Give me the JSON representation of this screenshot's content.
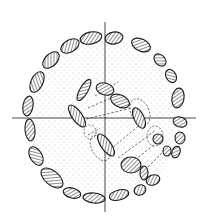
{
  "diagram": {
    "type": "archaeological-plan",
    "colors": {
      "ink": "#1a1a1a",
      "background": "#ffffff",
      "stipple": "#8a8a8a"
    },
    "axes": {
      "horizontal": {
        "x1": 12,
        "y1": 118,
        "x2": 196,
        "y2": 118
      },
      "vertical": {
        "x1": 105,
        "y1": 22,
        "x2": 105,
        "y2": 212
      }
    },
    "outer_ring": {
      "center": [
        105,
        118
      ],
      "radius": 82,
      "gap": "east-southeast opening between approx 10 and 60 degrees below east"
    },
    "outer_stones": [
      {
        "cx": 114,
        "cy": 38,
        "rx": 9,
        "ry": 6,
        "rot": -10
      },
      {
        "cx": 141,
        "cy": 45,
        "rx": 10,
        "ry": 6,
        "rot": 25
      },
      {
        "cx": 160,
        "cy": 60,
        "rx": 7,
        "ry": 5,
        "rot": 45
      },
      {
        "cx": 171,
        "cy": 76,
        "rx": 7,
        "ry": 5,
        "rot": 60
      },
      {
        "cx": 178,
        "cy": 98,
        "rx": 6,
        "ry": 10,
        "rot": 10
      },
      {
        "cx": 180,
        "cy": 122,
        "rx": 7,
        "ry": 5,
        "rot": 15
      },
      {
        "cx": 180,
        "cy": 138,
        "rx": 5,
        "ry": 6,
        "rot": 0
      },
      {
        "cx": 176,
        "cy": 152,
        "rx": 4,
        "ry": 6,
        "rot": 20
      },
      {
        "cx": 91,
        "cy": 38,
        "rx": 11,
        "ry": 6,
        "rot": -12
      },
      {
        "cx": 70,
        "cy": 46,
        "rx": 10,
        "ry": 6,
        "rot": -30
      },
      {
        "cx": 51,
        "cy": 60,
        "rx": 10,
        "ry": 6,
        "rot": -45
      },
      {
        "cx": 37,
        "cy": 82,
        "rx": 11,
        "ry": 6,
        "rot": -65
      },
      {
        "cx": 28,
        "cy": 106,
        "rx": 5,
        "ry": 10,
        "rot": 10
      },
      {
        "cx": 30,
        "cy": 130,
        "rx": 5,
        "ry": 11,
        "rot": -5
      },
      {
        "cx": 36,
        "cy": 156,
        "rx": 10,
        "ry": 6,
        "rot": 60
      },
      {
        "cx": 52,
        "cy": 178,
        "rx": 13,
        "ry": 7,
        "rot": 40
      },
      {
        "cx": 72,
        "cy": 193,
        "rx": 9,
        "ry": 5,
        "rot": 15
      },
      {
        "cx": 94,
        "cy": 198,
        "rx": 11,
        "ry": 5,
        "rot": 5
      },
      {
        "cx": 119,
        "cy": 195,
        "rx": 10,
        "ry": 5,
        "rot": -15
      },
      {
        "cx": 140,
        "cy": 190,
        "rx": 6,
        "ry": 5,
        "rot": -25
      }
    ],
    "inner_stones": [
      {
        "cx": 84,
        "cy": 90,
        "rx": 4,
        "ry": 12,
        "rot": 30
      },
      {
        "cx": 105,
        "cy": 89,
        "rx": 9,
        "ry": 6,
        "rot": 15
      },
      {
        "cx": 120,
        "cy": 101,
        "rx": 10,
        "ry": 6,
        "rot": 25
      },
      {
        "cx": 139,
        "cy": 118,
        "rx": 5,
        "ry": 11,
        "rot": -25
      },
      {
        "cx": 77,
        "cy": 116,
        "rx": 5,
        "ry": 13,
        "rot": -35
      },
      {
        "cx": 106,
        "cy": 145,
        "rx": 5,
        "ry": 13,
        "rot": -35
      },
      {
        "cx": 131,
        "cy": 165,
        "rx": 10,
        "ry": 8,
        "rot": 0
      },
      {
        "cx": 144,
        "cy": 173,
        "rx": 4,
        "ry": 7,
        "rot": 0
      },
      {
        "cx": 153,
        "cy": 180,
        "rx": 7,
        "ry": 5,
        "rot": -20
      },
      {
        "cx": 158,
        "cy": 139,
        "rx": 5,
        "ry": 5,
        "rot": 0
      },
      {
        "cx": 167,
        "cy": 151,
        "rx": 4,
        "ry": 5,
        "rot": 0
      }
    ],
    "dashed_lines": [
      {
        "x1": 88,
        "y1": 108,
        "x2": 118,
        "y2": 95
      },
      {
        "x1": 82,
        "y1": 120,
        "x2": 132,
        "y2": 108
      },
      {
        "x1": 95,
        "y1": 96,
        "x2": 118,
        "y2": 82
      },
      {
        "x1": 110,
        "y1": 150,
        "x2": 142,
        "y2": 123
      },
      {
        "x1": 118,
        "y1": 158,
        "x2": 156,
        "y2": 130
      },
      {
        "x1": 135,
        "y1": 160,
        "x2": 160,
        "y2": 140
      },
      {
        "x1": 145,
        "y1": 170,
        "x2": 165,
        "y2": 150
      },
      {
        "x1": 88,
        "y1": 135,
        "x2": 100,
        "y2": 128
      }
    ],
    "dashed_outlines": [
      {
        "cx": 140,
        "cy": 112,
        "rx": 9,
        "ry": 14,
        "rot": -25
      },
      {
        "cx": 100,
        "cy": 148,
        "rx": 8,
        "ry": 14,
        "rot": -30
      },
      {
        "cx": 155,
        "cy": 136,
        "rx": 8,
        "ry": 10,
        "rot": 0
      },
      {
        "cx": 90,
        "cy": 132,
        "rx": 6,
        "ry": 7,
        "rot": 0
      }
    ]
  }
}
